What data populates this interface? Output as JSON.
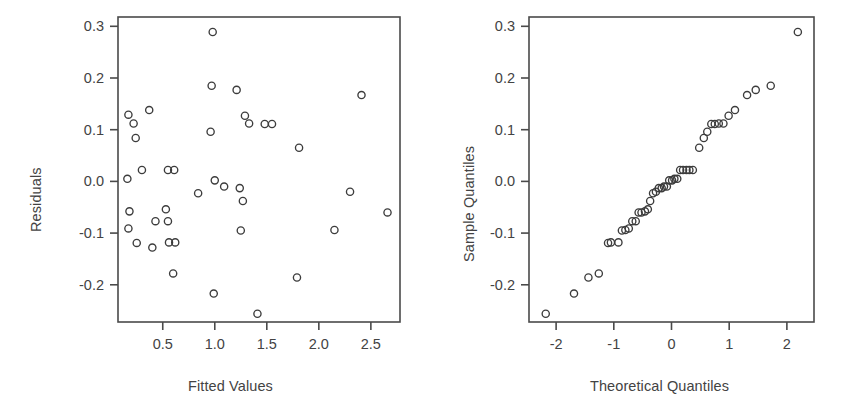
{
  "figure": {
    "width": 850,
    "height": 419,
    "background": "#ffffff",
    "foreground": "#434343",
    "point_color": "#3c3c3c"
  },
  "chart_data": [
    {
      "type": "scatter",
      "panel": "left",
      "title": "",
      "xlabel": "Fitted Values",
      "ylabel": "Residuals",
      "xticks": [
        "0.5",
        "1.0",
        "1.5",
        "2.0",
        "2.5"
      ],
      "xtick_values": [
        0.5,
        1.0,
        1.5,
        2.0,
        2.5
      ],
      "yticks": [
        "0.3",
        "0.2",
        "0.1",
        "0.0",
        "-0.1",
        "-0.2"
      ],
      "ytick_values": [
        0.3,
        0.2,
        0.1,
        0.0,
        -0.1,
        -0.2
      ],
      "xlim": [
        0.07,
        2.78
      ],
      "ylim": [
        -0.272,
        0.318
      ],
      "grid": false,
      "legend": "none",
      "marker": "open-circle",
      "x": [
        0.17,
        0.22,
        0.24,
        0.16,
        0.18,
        0.17,
        0.25,
        0.3,
        0.37,
        0.43,
        0.4,
        0.53,
        0.55,
        0.55,
        0.56,
        0.6,
        0.61,
        0.62,
        0.84,
        0.96,
        0.97,
        0.98,
        0.99,
        1.0,
        1.09,
        1.21,
        1.24,
        1.25,
        1.27,
        1.29,
        1.33,
        1.41,
        1.48,
        1.55,
        1.79,
        1.81,
        2.15,
        2.3,
        2.41,
        2.66
      ],
      "y": [
        0.129,
        0.112,
        0.084,
        0.005,
        -0.058,
        -0.091,
        -0.119,
        0.022,
        0.138,
        -0.077,
        -0.128,
        -0.054,
        -0.077,
        0.022,
        -0.118,
        -0.178,
        0.022,
        -0.118,
        -0.023,
        0.096,
        0.185,
        0.289,
        -0.217,
        0.002,
        -0.01,
        0.177,
        -0.013,
        -0.095,
        -0.038,
        0.127,
        0.112,
        -0.256,
        0.111,
        0.111,
        -0.186,
        0.065,
        -0.094,
        -0.02,
        0.167,
        -0.06
      ]
    },
    {
      "type": "scatter",
      "panel": "right",
      "title": "",
      "xlabel": "Theoretical Quantiles",
      "ylabel": "Sample Quantiles",
      "xticks": [
        "-2",
        "-1",
        "0",
        "1",
        "2"
      ],
      "xtick_values": [
        -2,
        -1,
        0,
        1,
        2
      ],
      "yticks": [
        "0.3",
        "0.2",
        "0.1",
        "0.0",
        "-0.1",
        "-0.2"
      ],
      "ytick_values": [
        0.3,
        0.2,
        0.1,
        0.0,
        -0.1,
        -0.2
      ],
      "xlim": [
        -2.47,
        2.47
      ],
      "ylim": [
        -0.272,
        0.318
      ],
      "grid": false,
      "legend": "none",
      "marker": "open-circle",
      "x": [
        -2.18,
        -1.69,
        -1.44,
        -1.26,
        -1.1,
        -1.05,
        -0.92,
        -0.86,
        -0.8,
        -0.74,
        -0.68,
        -0.62,
        -0.57,
        -0.52,
        -0.46,
        -0.41,
        -0.37,
        -0.32,
        -0.27,
        -0.22,
        -0.17,
        -0.13,
        -0.08,
        -0.04,
        0.01,
        0.05,
        0.1,
        0.15,
        0.2,
        0.26,
        0.31,
        0.37,
        0.48,
        0.56,
        0.62,
        0.69,
        0.75,
        0.82,
        0.9,
        0.99,
        1.1,
        1.31,
        1.46,
        1.72,
        2.19
      ],
      "y": [
        -0.256,
        -0.217,
        -0.186,
        -0.178,
        -0.119,
        -0.118,
        -0.118,
        -0.095,
        -0.094,
        -0.091,
        -0.077,
        -0.077,
        -0.06,
        -0.06,
        -0.058,
        -0.054,
        -0.038,
        -0.023,
        -0.02,
        -0.013,
        -0.013,
        -0.01,
        -0.01,
        0.002,
        0.002,
        0.005,
        0.005,
        0.022,
        0.022,
        0.022,
        0.022,
        0.022,
        0.065,
        0.084,
        0.096,
        0.111,
        0.111,
        0.112,
        0.112,
        0.127,
        0.138,
        0.167,
        0.177,
        0.185,
        0.289
      ]
    }
  ],
  "left_panel": {
    "xlabel": "Fitted Values",
    "ylabel": "Residuals",
    "xtick_labels": [
      "0.5",
      "1.0",
      "1.5",
      "2.0",
      "2.5"
    ],
    "ytick_labels": [
      "0.3",
      "0.2",
      "0.1",
      "0.0",
      "-0.1",
      "-0.2"
    ]
  },
  "right_panel": {
    "xlabel": "Theoretical Quantiles",
    "ylabel": "Sample Quantiles",
    "xtick_labels": [
      "-2",
      "-1",
      "0",
      "1",
      "2"
    ],
    "ytick_labels": [
      "0.3",
      "0.2",
      "0.1",
      "0.0",
      "-0.1",
      "-0.2"
    ]
  }
}
